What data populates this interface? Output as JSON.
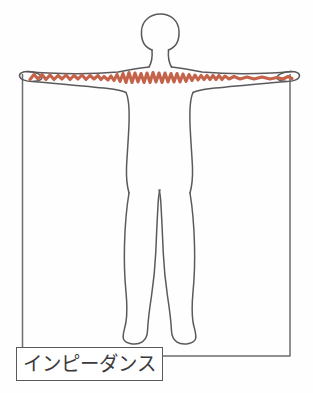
{
  "diagram": {
    "title_label": "インピーダンス",
    "measurement_label": "インピーダンス",
    "colors": {
      "outline": "#5a5a5d",
      "signal": "#c4624a",
      "frame": "#6d6d70",
      "label_border": "#59595c",
      "label_text": "#3b3b3e",
      "background": "#fefefe"
    },
    "frame": {
      "left_x": 22,
      "right_x": 290,
      "top_y": 74,
      "bottom_y": 356
    },
    "signal_path": {
      "name": "impedance-signal-trace",
      "description": "jagged waveform traced from left hand across both arms and chest to right hand",
      "start_x": 28,
      "end_x": 292,
      "baseline_y": 78
    },
    "body": {
      "head": {
        "cx": 160,
        "cy": 32,
        "rx": 18,
        "ry": 19
      },
      "arm_span_left_x": 24,
      "arm_span_right_x": 292,
      "shoulder_y": 70,
      "torso_left_x": 128,
      "torso_right_x": 186,
      "crotch_y": 190,
      "feet_bottom_y": 345
    }
  }
}
